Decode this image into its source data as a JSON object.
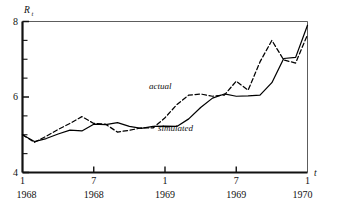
{
  "figure": {
    "background": "#ffffff",
    "ink_color": "#000000"
  },
  "axes": {
    "y_axis_name": "R",
    "y_axis_subscript": "t",
    "x_axis_name": "t",
    "y_ticks_labeled": [
      "4",
      "6",
      "8"
    ],
    "x_ticks_month": [
      "1",
      "7",
      "1",
      "7",
      "1"
    ],
    "x_ticks_year": [
      "1968",
      "1968",
      "1969",
      "1969",
      "1970"
    ]
  },
  "annotations": {
    "actual_label": "actual",
    "simulated_label": "simulated"
  },
  "chart_data": {
    "type": "line",
    "title": "",
    "xlabel": "t",
    "ylabel": "R_t",
    "ylim": [
      4,
      8
    ],
    "yticks": [
      4,
      4.5,
      5,
      5.5,
      6,
      6.5,
      7,
      7.5,
      8
    ],
    "ytick_labels": [
      "4",
      "",
      "",
      "",
      "6",
      "",
      "",
      "",
      "8"
    ],
    "grid": false,
    "legend": "inline-annotations",
    "x_major_labels": [
      {
        "month": "1",
        "year": "1968"
      },
      {
        "month": "7",
        "year": "1968"
      },
      {
        "month": "1",
        "year": "1969"
      },
      {
        "month": "7",
        "year": "1969"
      },
      {
        "month": "1",
        "year": "1970"
      }
    ],
    "x": [
      "1968-01",
      "1968-02",
      "1968-03",
      "1968-04",
      "1968-05",
      "1968-06",
      "1968-07",
      "1968-08",
      "1968-09",
      "1968-10",
      "1968-11",
      "1968-12",
      "1969-01",
      "1969-02",
      "1969-03",
      "1969-04",
      "1969-05",
      "1969-06",
      "1969-07",
      "1969-08",
      "1969-09",
      "1969-10",
      "1969-11",
      "1969-12",
      "1970-01"
    ],
    "series": [
      {
        "name": "simulated",
        "style": "solid",
        "values": [
          5.0,
          4.82,
          4.9,
          5.02,
          5.12,
          5.1,
          5.28,
          5.27,
          5.32,
          5.22,
          5.17,
          5.22,
          5.23,
          5.22,
          5.42,
          5.72,
          5.97,
          6.08,
          6.02,
          6.03,
          6.05,
          6.38,
          7.02,
          7.05,
          7.9
        ]
      },
      {
        "name": "actual",
        "style": "dashed",
        "values": [
          5.0,
          4.8,
          4.96,
          5.14,
          5.3,
          5.48,
          5.3,
          5.28,
          5.07,
          5.12,
          5.18,
          5.18,
          5.45,
          5.8,
          6.05,
          6.08,
          6.02,
          6.05,
          6.42,
          6.18,
          6.93,
          7.5,
          6.98,
          6.9,
          7.65
        ]
      }
    ]
  }
}
